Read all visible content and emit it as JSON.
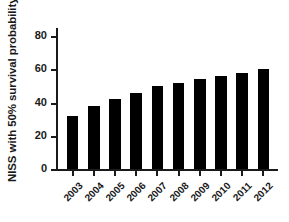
{
  "chart_data": {
    "type": "bar",
    "title": "",
    "subtitle": "",
    "xlabel": "",
    "ylabel": "NISS with 50% survival probability",
    "categories": [
      "2003",
      "2004",
      "2005",
      "2006",
      "2007",
      "2008",
      "2009",
      "2010",
      "2011",
      "2012"
    ],
    "values": [
      32,
      38,
      42,
      46,
      50,
      52,
      54,
      56,
      58,
      60
    ],
    "series": [
      {
        "name": "NISS with 50% survival probability",
        "values": [
          32,
          38,
          42,
          46,
          50,
          52,
          54,
          56,
          58,
          60
        ]
      }
    ],
    "ylim": [
      0,
      85
    ],
    "yticks": [
      0,
      20,
      40,
      60,
      80
    ],
    "ytick_labels": [
      "0",
      "20",
      "40",
      "60",
      "80"
    ],
    "xtick_labels": [
      "2003",
      "2004",
      "2005",
      "2006",
      "2007",
      "2008",
      "2009",
      "2010",
      "2011",
      "2012"
    ],
    "grid": false,
    "legend": false,
    "legend_position": "none",
    "bar_color": "#000000",
    "axis_color": "#1a1a1a",
    "background_color": "#ffffff",
    "xtick_label_rotation": -45
  }
}
